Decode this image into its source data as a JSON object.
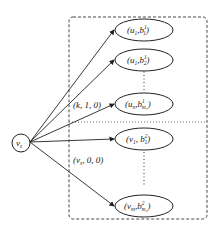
{
  "diagram": {
    "source_node": {
      "label": "v",
      "subscript": "s"
    },
    "group_box": {
      "style": "dashed"
    },
    "divider": {
      "style": "dotted"
    },
    "edge_labels": [
      {
        "text": "(k, 1, 0)"
      },
      {
        "text": "(v",
        "sub": "s",
        "rest": ", 0, 0)"
      }
    ],
    "upper_nodes": [
      {
        "name": "u",
        "name_sub": "1",
        "b_sup": "1",
        "b_sub": "1"
      },
      {
        "name": "u",
        "name_sub": "1",
        "b_sup": "1",
        "b_sub": "2"
      },
      {
        "name": "u",
        "name_sub": "n",
        "b_sup": "1",
        "b_sub": "m₁"
      }
    ],
    "lower_nodes": [
      {
        "name": "v",
        "name_sub": "1",
        "b_sup": "2",
        "b_sub": "1"
      },
      {
        "name": "v",
        "name_sub": "m",
        "b_sup": "2",
        "b_sub": "m₂"
      }
    ],
    "colors": {
      "stroke": "#222222",
      "background": "#ffffff"
    }
  }
}
